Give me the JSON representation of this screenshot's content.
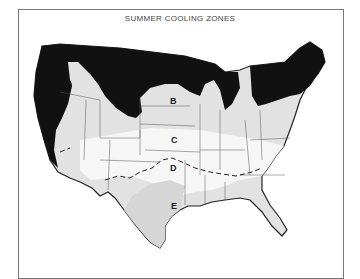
{
  "map": {
    "title": "SUMMER COOLING ZONES",
    "zones": [
      {
        "id": "A",
        "label": "",
        "fill": "#111111"
      },
      {
        "id": "B",
        "label": "B",
        "fill": "#dddddd"
      },
      {
        "id": "C",
        "label": "C",
        "fill": "#f3f3f3"
      },
      {
        "id": "D",
        "label": "D",
        "fill": "#f3f3f3"
      },
      {
        "id": "E",
        "label": "E",
        "fill": "#dddddd"
      }
    ]
  }
}
